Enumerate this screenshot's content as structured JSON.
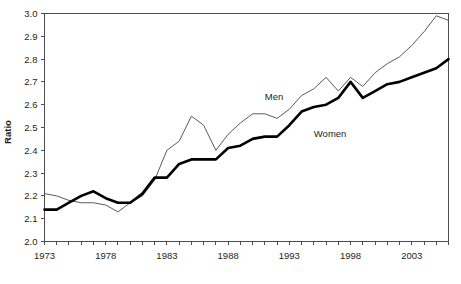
{
  "chart_data": {
    "type": "line",
    "title": "",
    "xlabel": "",
    "ylabel": "Ratio",
    "xlim": [
      1973,
      2006
    ],
    "ylim": [
      2.0,
      3.0
    ],
    "grid": false,
    "legend_position": "inline-labels",
    "x": [
      1973,
      1974,
      1975,
      1976,
      1977,
      1978,
      1979,
      1980,
      1981,
      1982,
      1983,
      1984,
      1985,
      1986,
      1987,
      1988,
      1989,
      1990,
      1991,
      1992,
      1993,
      1994,
      1995,
      1996,
      1997,
      1998,
      1999,
      2000,
      2001,
      2002,
      2003,
      2004,
      2005,
      2006
    ],
    "x_tick_labels": [
      "1973",
      "1978",
      "1983",
      "1988",
      "1993",
      "1998",
      "2003"
    ],
    "x_tick_values": [
      1973,
      1978,
      1983,
      1988,
      1993,
      1998,
      2003
    ],
    "y_tick_labels": [
      "2.0",
      "2.1",
      "2.2",
      "2.3",
      "2.4",
      "2.5",
      "2.6",
      "2.7",
      "2.8",
      "2.9",
      "3.0"
    ],
    "y_tick_values": [
      2.0,
      2.1,
      2.2,
      2.3,
      2.4,
      2.5,
      2.6,
      2.7,
      2.8,
      2.9,
      3.0
    ],
    "series": [
      {
        "name": "Men",
        "color": "#58595b",
        "line_width": 1,
        "label_x": 1991,
        "label_y": 2.62,
        "values": [
          2.21,
          2.2,
          2.18,
          2.17,
          2.17,
          2.16,
          2.13,
          2.17,
          2.2,
          2.27,
          2.4,
          2.44,
          2.55,
          2.51,
          2.4,
          2.47,
          2.52,
          2.56,
          2.56,
          2.54,
          2.58,
          2.64,
          2.67,
          2.72,
          2.66,
          2.72,
          2.68,
          2.74,
          2.78,
          2.81,
          2.86,
          2.92,
          2.99,
          2.97
        ]
      },
      {
        "name": "Women",
        "color": "#000000",
        "line_width": 2.6,
        "label_x": 1995,
        "label_y": 2.46,
        "values": [
          2.14,
          2.14,
          2.17,
          2.2,
          2.22,
          2.19,
          2.17,
          2.17,
          2.21,
          2.28,
          2.28,
          2.34,
          2.36,
          2.36,
          2.36,
          2.41,
          2.42,
          2.45,
          2.46,
          2.46,
          2.51,
          2.57,
          2.59,
          2.6,
          2.63,
          2.7,
          2.63,
          2.66,
          2.69,
          2.7,
          2.72,
          2.74,
          2.76,
          2.8
        ]
      }
    ]
  }
}
